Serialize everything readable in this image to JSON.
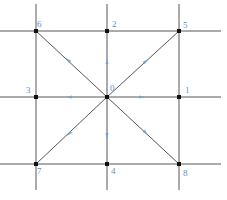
{
  "diagram": {
    "type": "lattice-velocity-stencil",
    "colors": {
      "line": "#444444",
      "node": "#111111",
      "label": "#5b8fc7",
      "arrow": "#6fa0d6"
    },
    "grid": {
      "vertical_x": [
        36,
        107,
        179
      ],
      "horizontal_y": [
        31,
        97,
        164
      ],
      "extent": {
        "x_min": 0,
        "x_max": 221,
        "y_min": 4,
        "y_max": 190
      }
    },
    "nodes": [
      {
        "id": "0",
        "x": 107,
        "y": 97,
        "label_dx": 3,
        "label_dy": -13
      },
      {
        "id": "1",
        "x": 179,
        "y": 97,
        "label_dx": 6,
        "label_dy": -11
      },
      {
        "id": "2",
        "x": 107,
        "y": 31,
        "label_dx": 5,
        "label_dy": -11
      },
      {
        "id": "3",
        "x": 36,
        "y": 97,
        "label_dx": -10,
        "label_dy": -11
      },
      {
        "id": "4",
        "x": 107,
        "y": 164,
        "label_dx": 4,
        "label_dy": 3
      },
      {
        "id": "5",
        "x": 179,
        "y": 31,
        "label_dx": 4,
        "label_dy": -10
      },
      {
        "id": "6",
        "x": 36,
        "y": 31,
        "label_dx": 1,
        "label_dy": -11
      },
      {
        "id": "7",
        "x": 36,
        "y": 164,
        "label_dx": 1,
        "label_dy": 3
      },
      {
        "id": "8",
        "x": 179,
        "y": 164,
        "label_dx": 4,
        "label_dy": 5
      }
    ],
    "arrows": [
      {
        "to": "1",
        "x": 142,
        "y": 97
      },
      {
        "to": "2",
        "x": 107,
        "y": 61
      },
      {
        "to": "3",
        "x": 69,
        "y": 97
      },
      {
        "to": "4",
        "x": 107,
        "y": 136
      },
      {
        "to": "5",
        "x": 146,
        "y": 61
      },
      {
        "to": "6",
        "x": 68,
        "y": 60
      },
      {
        "to": "7",
        "x": 69,
        "y": 134
      },
      {
        "to": "8",
        "x": 146,
        "y": 133
      }
    ]
  }
}
